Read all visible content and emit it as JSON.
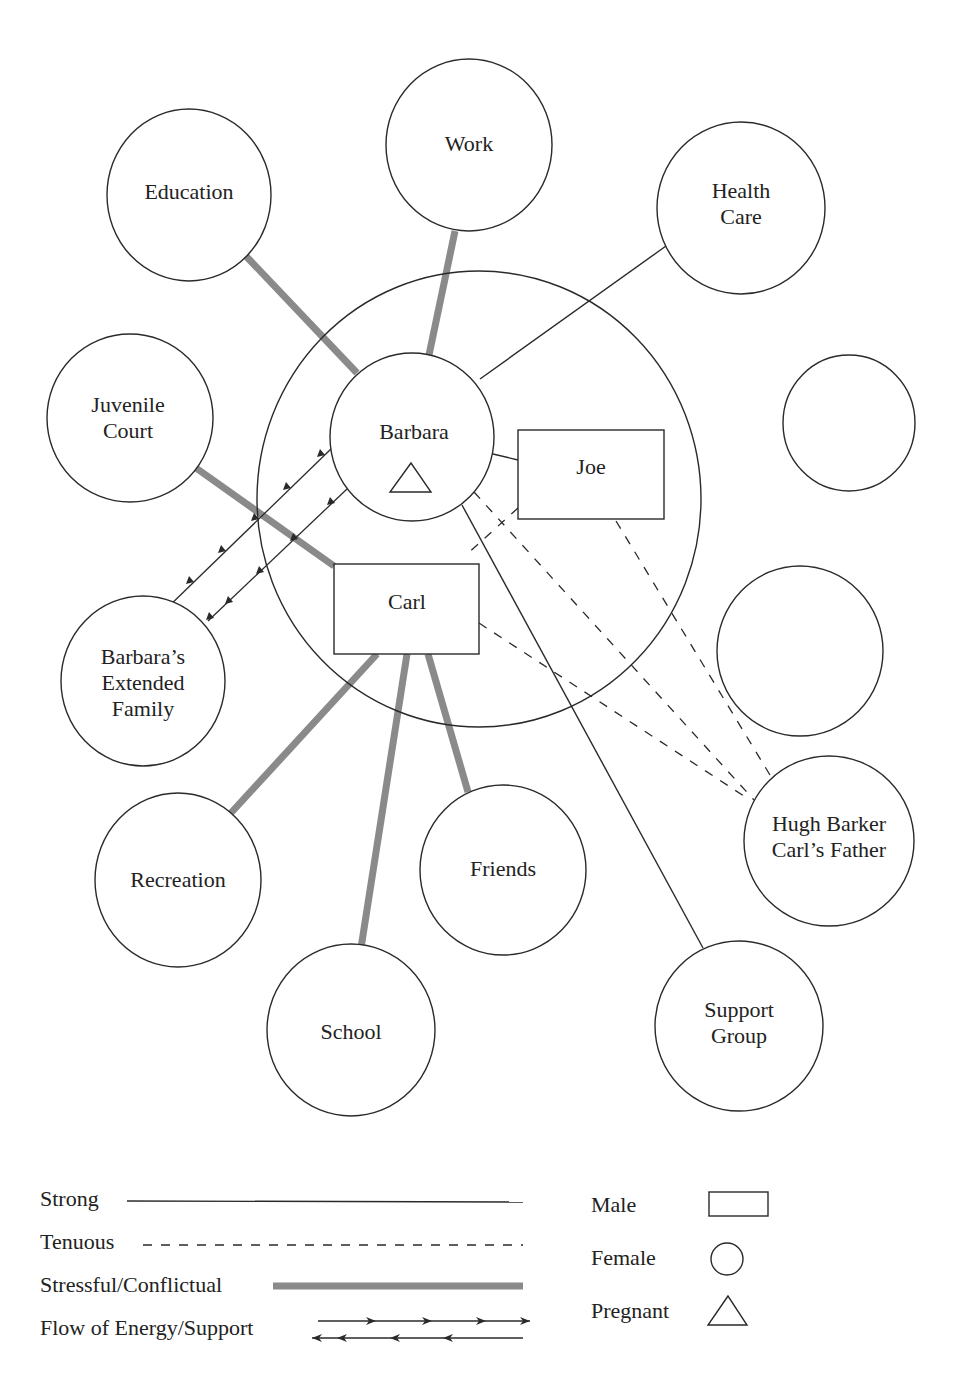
{
  "diagram": {
    "type": "ecomap",
    "household_boundary": "circle",
    "nodes": {
      "barbara": {
        "label": "Barbara",
        "shape": "circle",
        "gender": "female",
        "pregnant": true
      },
      "joe": {
        "label": "Joe",
        "shape": "rectangle",
        "gender": "male"
      },
      "carl": {
        "label": "Carl",
        "shape": "rectangle",
        "gender": "male"
      },
      "education": {
        "lines": [
          "Education"
        ]
      },
      "work": {
        "lines": [
          "Work"
        ]
      },
      "health_care": {
        "lines": [
          "Health",
          "Care"
        ]
      },
      "juvenile_court": {
        "lines": [
          "Juvenile",
          "Court"
        ]
      },
      "extended_family": {
        "lines": [
          "Barbara’s",
          "Extended",
          "Family"
        ]
      },
      "recreation": {
        "lines": [
          "Recreation"
        ]
      },
      "friends": {
        "lines": [
          "Friends"
        ]
      },
      "school": {
        "lines": [
          "School"
        ]
      },
      "hugh_barker": {
        "lines": [
          "Hugh Barker",
          "Carl’s Father"
        ]
      },
      "support_group": {
        "lines": [
          "Support",
          "Group"
        ]
      },
      "empty_1": {
        "lines": []
      },
      "empty_2": {
        "lines": []
      }
    },
    "connections": [
      {
        "from": "Barbara",
        "to": "Education",
        "type": "stressful"
      },
      {
        "from": "Barbara",
        "to": "Work",
        "type": "stressful"
      },
      {
        "from": "Barbara",
        "to": "Health Care",
        "type": "strong"
      },
      {
        "from": "Barbara",
        "to": "Joe",
        "type": "strong"
      },
      {
        "from": "Barbara",
        "to": "Support Group",
        "type": "strong"
      },
      {
        "from": "Barbara",
        "to": "Hugh Barker",
        "type": "tenuous"
      },
      {
        "from": "Barbara",
        "to": "Barbara's Extended Family",
        "type": "flow"
      },
      {
        "from": "Carl",
        "to": "Juvenile Court",
        "type": "stressful"
      },
      {
        "from": "Carl",
        "to": "Recreation",
        "type": "stressful"
      },
      {
        "from": "Carl",
        "to": "School",
        "type": "stressful"
      },
      {
        "from": "Carl",
        "to": "Friends",
        "type": "stressful"
      },
      {
        "from": "Carl",
        "to": "Hugh Barker",
        "type": "tenuous"
      },
      {
        "from": "Carl",
        "to": "Barbara's Extended Family",
        "type": "flow"
      },
      {
        "from": "Joe",
        "to": "Carl",
        "type": "tenuous"
      },
      {
        "from": "Joe",
        "to": "Hugh Barker",
        "type": "tenuous"
      }
    ]
  },
  "legend": {
    "lines": [
      {
        "label": "Strong",
        "style": "strong"
      },
      {
        "label": "Tenuous",
        "style": "tenuous"
      },
      {
        "label": "Stressful/Conflictual",
        "style": "stressful"
      },
      {
        "label": "Flow of Energy/Support",
        "style": "flow"
      }
    ],
    "shapes": [
      {
        "label": "Male",
        "shape": "rectangle"
      },
      {
        "label": "Female",
        "shape": "circle"
      },
      {
        "label": "Pregnant",
        "shape": "triangle"
      }
    ]
  },
  "colors": {
    "stroke": "#2a2a2a",
    "stressful": "#8a8a8a",
    "background": "#ffffff"
  }
}
